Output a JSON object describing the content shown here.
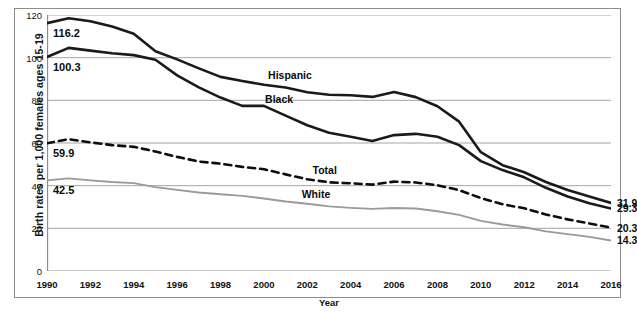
{
  "chart_data": {
    "type": "line",
    "title": "",
    "xlabel": "Year",
    "ylabel": "Birth rates per 1,000 females ages 15-19",
    "xlim": [
      1990,
      2016
    ],
    "ylim": [
      0,
      120
    ],
    "yticks": [
      0,
      20,
      40,
      60,
      80,
      100,
      120
    ],
    "xticks": [
      1990,
      1992,
      1994,
      1996,
      1998,
      2000,
      2002,
      2004,
      2006,
      2008,
      2010,
      2012,
      2014,
      2016
    ],
    "grid": "horizontal",
    "legend_position": "inline-labels",
    "x": [
      1990,
      1991,
      1992,
      1993,
      1994,
      1995,
      1996,
      1997,
      1998,
      1999,
      2000,
      2001,
      2002,
      2003,
      2004,
      2005,
      2006,
      2007,
      2008,
      2009,
      2010,
      2011,
      2012,
      2013,
      2014,
      2015,
      2016
    ],
    "series": [
      {
        "name": "Hispanic",
        "color": "#1a1a1a",
        "style": "solid",
        "width": 2.6,
        "label_x": 2001.2,
        "label_y": 92.0,
        "start_value": 116.2,
        "end_value": 31.9,
        "values": [
          116.2,
          118.5,
          117.1,
          114.6,
          111.2,
          103.0,
          99.2,
          95.0,
          91.0,
          89.1,
          87.3,
          86.0,
          83.8,
          82.6,
          82.4,
          81.6,
          83.9,
          81.5,
          77.2,
          70.0,
          55.7,
          49.6,
          46.3,
          41.7,
          38.0,
          34.9,
          31.9
        ]
      },
      {
        "name": "Black",
        "color": "#1a1a1a",
        "style": "solid",
        "width": 2.6,
        "label_x": 2000.7,
        "label_y": 80.6,
        "start_value": 100.3,
        "end_value": 29.3,
        "values": [
          100.3,
          104.6,
          103.3,
          102.1,
          101.2,
          99.0,
          91.7,
          86.1,
          81.3,
          77.4,
          77.4,
          72.8,
          68.3,
          64.8,
          62.9,
          60.9,
          63.7,
          64.3,
          62.9,
          59.0,
          51.5,
          47.3,
          43.9,
          39.0,
          34.9,
          31.8,
          29.3
        ]
      },
      {
        "name": "Total",
        "color": "#0d0d0d",
        "style": "dashed",
        "width": 2.6,
        "label_x": 2002.8,
        "label_y": 47.5,
        "start_value": 59.9,
        "end_value": 20.3,
        "values": [
          59.9,
          61.8,
          60.3,
          59.0,
          58.2,
          56.0,
          53.5,
          51.3,
          50.3,
          48.8,
          47.7,
          45.3,
          43.0,
          41.6,
          41.1,
          40.5,
          41.9,
          41.5,
          40.2,
          37.9,
          34.2,
          31.3,
          29.4,
          26.5,
          24.2,
          22.3,
          20.3
        ]
      },
      {
        "name": "White",
        "color": "#9a9a9a",
        "style": "solid",
        "width": 1.9,
        "label_x": 2002.4,
        "label_y": 36.0,
        "start_value": 42.5,
        "end_value": 14.3,
        "values": [
          42.5,
          43.4,
          42.5,
          41.7,
          41.2,
          39.3,
          38.0,
          36.8,
          36.0,
          35.2,
          34.0,
          32.6,
          31.5,
          30.3,
          29.6,
          29.1,
          29.5,
          29.3,
          28.0,
          26.3,
          23.5,
          21.8,
          20.5,
          18.6,
          17.3,
          16.0,
          14.3
        ]
      }
    ],
    "end_labels": [
      {
        "text": "31.9",
        "value": 31.9
      },
      {
        "text": "29.3",
        "value": 29.3
      },
      {
        "text": "20.3",
        "value": 20.3
      },
      {
        "text": "14.3",
        "value": 14.3
      }
    ],
    "start_labels": [
      {
        "text": "116.2",
        "value": 116.2
      },
      {
        "text": "100.3",
        "value": 100.3
      },
      {
        "text": "59.9",
        "value": 59.9
      },
      {
        "text": "42.5",
        "value": 42.5
      }
    ],
    "axis_color": "#8d8d8d",
    "grid_color": "#9b9b9b",
    "background": "#ffffff"
  }
}
